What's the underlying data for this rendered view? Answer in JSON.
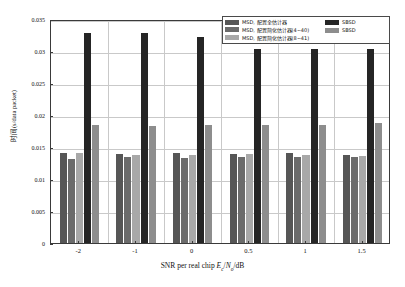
{
  "chart_data": {
    "type": "bar",
    "title": "",
    "xlabel": "SNR per real chip Ec/No/dB",
    "ylabel": "时间(s/data packet)",
    "categories": [
      "-2",
      "-1",
      "0",
      "0.5",
      "1",
      "1.5"
    ],
    "ylim": [
      0,
      0.035
    ],
    "yticks": [
      "0",
      "0.005",
      "0.01",
      "0.015",
      "0.02",
      "0.025",
      "0.03",
      "0.035"
    ],
    "ytick_values": [
      0,
      0.005,
      0.01,
      0.015,
      0.02,
      0.025,
      0.03,
      0.035
    ],
    "grid": true,
    "legend_position": "top-right",
    "series": [
      {
        "name": "MSD, 配置全估计器",
        "color": "#565656",
        "values": [
          0.014,
          0.0139,
          0.014,
          0.0139,
          0.014,
          0.0137
        ]
      },
      {
        "name": "MSD, 配置简化估计器(4~40)",
        "color": "#6b6b6b",
        "values": [
          0.0131,
          0.0134,
          0.0133,
          0.0134,
          0.0135,
          0.0134
        ]
      },
      {
        "name": "MSD, 配置简化估计器(8~41)",
        "color": "#a8a8a8",
        "values": [
          0.014,
          0.0137,
          0.0138,
          0.0139,
          0.0138,
          0.0136
        ]
      },
      {
        "name": "SBSD",
        "color": "#252525",
        "values": [
          0.0328,
          0.0328,
          0.0322,
          0.0303,
          0.0303,
          0.0303
        ]
      },
      {
        "name": "SBSD",
        "color": "#8d8d8d",
        "values": [
          0.0185,
          0.0183,
          0.0184,
          0.0184,
          0.0185,
          0.0187
        ]
      }
    ]
  },
  "axis": {
    "xlabel_prefix": "SNR per real chip ",
    "xlabel_e": "E",
    "xlabel_c": "c",
    "xlabel_slash": "/",
    "xlabel_n": "N",
    "xlabel_o": "o",
    "xlabel_suffix": "/dB",
    "ylabel_text": "时间(s/data packet)"
  }
}
